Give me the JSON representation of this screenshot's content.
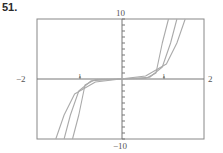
{
  "problem_number": "51.",
  "chart_data": {
    "type": "line",
    "title": "",
    "xlabel": "",
    "ylabel": "",
    "xlim": [
      -2,
      2
    ],
    "ylim": [
      -10,
      10
    ],
    "x_tick_labels": {
      "left": "-2",
      "right": "2",
      "inner_left": "1",
      "inner_right": "1"
    },
    "y_tick_labels": {
      "top": "10",
      "bottom": "-10"
    },
    "grid": false,
    "legend": null,
    "series": [
      {
        "name": "curve-1 (steepest)",
        "description": "odd power function, steepest",
        "points": [
          [
            -1.15,
            -10
          ],
          [
            -1.0,
            -6
          ],
          [
            -0.85,
            -1
          ],
          [
            -0.6,
            -0.1
          ],
          [
            0,
            0
          ],
          [
            0.6,
            0.1
          ],
          [
            0.85,
            1
          ],
          [
            1.0,
            6
          ],
          [
            1.15,
            10
          ]
        ]
      },
      {
        "name": "curve-2",
        "description": "odd power function, middle",
        "points": [
          [
            -1.35,
            -10
          ],
          [
            -1.2,
            -6
          ],
          [
            -1.0,
            -2
          ],
          [
            -0.7,
            -0.3
          ],
          [
            0,
            0
          ],
          [
            0.7,
            0.3
          ],
          [
            1.0,
            2
          ],
          [
            1.2,
            6
          ],
          [
            1.35,
            10
          ]
        ]
      },
      {
        "name": "curve-3 (shallowest)",
        "description": "odd power function, shallowest",
        "points": [
          [
            -1.55,
            -10
          ],
          [
            -1.35,
            -6
          ],
          [
            -1.1,
            -2.5
          ],
          [
            -0.6,
            -0.5
          ],
          [
            0,
            0
          ],
          [
            0.6,
            0.5
          ],
          [
            1.1,
            2.5
          ],
          [
            1.35,
            6
          ],
          [
            1.55,
            10
          ]
        ]
      }
    ]
  },
  "labels": {
    "x_min": "−2",
    "x_max": "2",
    "y_max": "10",
    "y_min": "−10",
    "x_tick_left": "1",
    "x_tick_right": "1"
  }
}
